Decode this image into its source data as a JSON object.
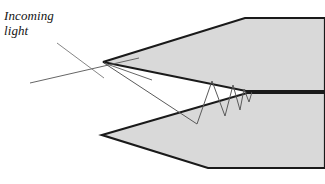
{
  "figure": {
    "background_color": "#ffffff",
    "width": 325,
    "height": 184,
    "labels": {
      "incoming_light": "Incoming\nlight"
    },
    "colors": {
      "wedge_fill": "#d9d9d9",
      "wedge_stroke": "#1a1a1a",
      "ray_stroke": "#555555",
      "label_text": "#141414"
    },
    "geometry": {
      "upper_wedge": {
        "name": "upper-wedge-surface",
        "apex": [
          103,
          62
        ],
        "points": "103,62 245,18 325,18 325,91 246,91"
      },
      "lower_wedge": {
        "name": "lower-wedge-surface",
        "apex": [
          102,
          135
        ],
        "points": "102,135 247,93 325,93 325,168 208,168"
      },
      "incoming_rays": [
        {
          "name": "primary-incoming-ray",
          "from": [
            30,
            83
          ],
          "to": [
            139,
            58
          ]
        },
        {
          "name": "secondary-incoming-ray",
          "from": [
            57,
            43
          ],
          "to": [
            104,
            78
          ]
        }
      ],
      "bounce_path": {
        "name": "internal-reflection-path",
        "points": "104,63 197,124 212,81 225,116 233,85 240,110 244,89 249,102 252,92"
      },
      "entry_ray": {
        "name": "entry-segment",
        "from": [
          104,
          63
        ],
        "to": [
          152,
          80
        ]
      },
      "exit_line": {
        "name": "convergence-exit-line",
        "from": [
          252,
          92
        ],
        "to": [
          325,
          92
        ]
      }
    }
  }
}
